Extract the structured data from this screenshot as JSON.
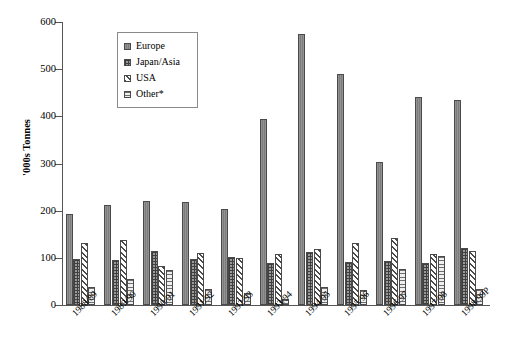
{
  "chart_data": {
    "type": "bar",
    "title": "",
    "xlabel": "",
    "ylabel": "'000s Tonnes",
    "ylim": [
      0,
      600
    ],
    "ytick_step": 100,
    "grid": false,
    "legend_position": "upper-left-inside",
    "yticks": [
      "0",
      "100",
      "200",
      "300",
      "400",
      "500",
      "600"
    ],
    "categories": [
      "1988/89",
      "1989/90",
      "1990/91",
      "1991/92",
      "1992/93",
      "1993/94",
      "1994/95",
      "1995/96",
      "1996/97",
      "1997/98",
      "1998/99P"
    ],
    "series": [
      {
        "name": "Europe",
        "pattern": "solid-gray",
        "color": "#7d7d7d",
        "values": [
          192,
          211,
          220,
          218,
          204,
          395,
          575,
          490,
          303,
          440,
          435
        ]
      },
      {
        "name": "Japan/Asia",
        "pattern": "fine-grid",
        "color": "#9a9a9a",
        "values": [
          97,
          95,
          115,
          97,
          101,
          89,
          112,
          91,
          93,
          89,
          121
        ]
      },
      {
        "name": "USA",
        "pattern": "diagonal-hatch",
        "color": "#ffffff",
        "values": [
          132,
          137,
          83,
          110,
          100,
          109,
          119,
          132,
          142,
          109,
          114
        ]
      },
      {
        "name": "Other*",
        "pattern": "horizontal-lines",
        "color": "#efefef",
        "values": [
          38,
          55,
          75,
          33,
          26,
          12,
          39,
          32,
          77,
          104,
          35
        ]
      }
    ]
  },
  "legend": {
    "items": [
      {
        "label": "Europe"
      },
      {
        "label": "Japan/Asia"
      },
      {
        "label": "USA"
      },
      {
        "label": "Other*"
      }
    ]
  }
}
